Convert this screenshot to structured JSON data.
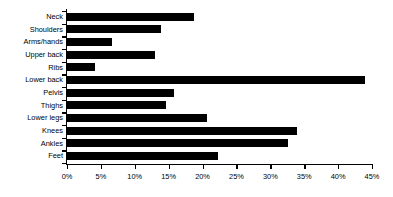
{
  "chart_data": {
    "type": "bar",
    "orientation": "horizontal",
    "title": "",
    "subtitle": "",
    "xlabel": "",
    "ylabel": "",
    "xlim": [
      0,
      45
    ],
    "ylim": null,
    "grid": false,
    "legend": null,
    "legend_position": "none",
    "bar_color": "#000000",
    "axis_color": "#000000",
    "background_color": "#FFFFFF",
    "xtick_labels": [
      "0%",
      "5%",
      "10%",
      "15%",
      "20%",
      "25%",
      "30%",
      "35%",
      "40%",
      "45%"
    ],
    "xtick_values": [
      0,
      5,
      10,
      15,
      20,
      25,
      30,
      35,
      40,
      45
    ],
    "value_suffix": "%",
    "categories": [
      "Neck",
      "Shoulders",
      "Arms/hands",
      "Upper back",
      "Ribs",
      "Lower back",
      "Pelvis",
      "Thighs",
      "Lower legs",
      "Knees",
      "Ankles",
      "Feet"
    ],
    "values": [
      18.7,
      13.9,
      6.6,
      13.0,
      4.1,
      44.0,
      15.8,
      14.6,
      20.7,
      34.0,
      32.6,
      22.3
    ]
  }
}
